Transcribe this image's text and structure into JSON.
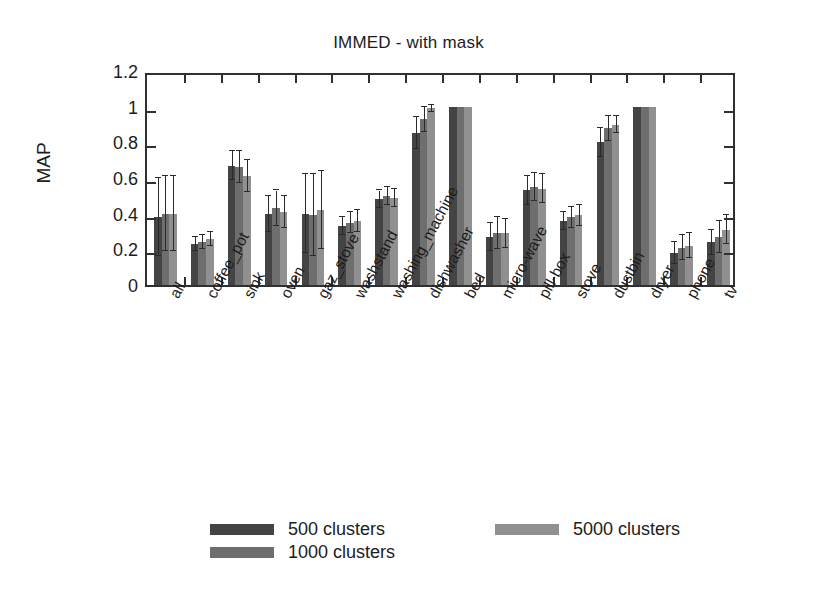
{
  "chart_data": {
    "type": "bar",
    "title": "IMMED - with mask",
    "xlabel": "",
    "ylabel": "MAP",
    "ylim": [
      0,
      1.2
    ],
    "yticks": [
      "0",
      "0.2",
      "0.4",
      "0.6",
      "0.8",
      "1",
      "1.2"
    ],
    "ytick_values": [
      0,
      0.2,
      0.4,
      0.6,
      0.8,
      1.0,
      1.2
    ],
    "grid": false,
    "legend_position": "below-plot",
    "error_bars": "yes",
    "categories": [
      "all",
      "coffee_pot",
      "sink",
      "oven",
      "gaz_stove",
      "washstand",
      "washing_machine",
      "dishwasher",
      "bed",
      "micro-wave",
      "pill-box",
      "stove",
      "dustbin",
      "dryer",
      "phone",
      "tv"
    ],
    "series": [
      {
        "name": "500 clusters",
        "color": "#444444",
        "values": [
          0.38,
          0.23,
          0.67,
          0.4,
          0.4,
          0.33,
          0.48,
          0.85,
          1.0,
          0.27,
          0.53,
          0.36,
          0.8,
          1.0,
          0.18,
          0.24
        ],
        "err_upper": [
          0.22,
          0.04,
          0.08,
          0.1,
          0.22,
          0.05,
          0.05,
          0.09,
          0.0,
          0.08,
          0.08,
          0.05,
          0.08,
          0.0,
          0.06,
          0.07
        ],
        "err_lower": [
          0.22,
          0.04,
          0.08,
          0.1,
          0.22,
          0.05,
          0.05,
          0.09,
          0.0,
          0.08,
          0.08,
          0.05,
          0.08,
          0.0,
          0.06,
          0.07
        ]
      },
      {
        "name": "1000 clusters",
        "color": "#6e6e6e",
        "values": [
          0.4,
          0.24,
          0.66,
          0.43,
          0.39,
          0.35,
          0.5,
          0.93,
          1.0,
          0.29,
          0.55,
          0.38,
          0.88,
          1.0,
          0.21,
          0.27
        ],
        "err_upper": [
          0.21,
          0.04,
          0.09,
          0.1,
          0.23,
          0.06,
          0.05,
          0.07,
          0.0,
          0.09,
          0.08,
          0.06,
          0.07,
          0.0,
          0.07,
          0.09
        ],
        "err_lower": [
          0.21,
          0.04,
          0.09,
          0.1,
          0.23,
          0.06,
          0.05,
          0.07,
          0.0,
          0.09,
          0.08,
          0.06,
          0.07,
          0.0,
          0.07,
          0.09
        ]
      },
      {
        "name": "5000 clusters",
        "color": "#909090",
        "values": [
          0.4,
          0.26,
          0.61,
          0.41,
          0.42,
          0.36,
          0.49,
          0.99,
          1.0,
          0.29,
          0.54,
          0.39,
          0.9,
          1.0,
          0.22,
          0.31
        ],
        "err_upper": [
          0.21,
          0.04,
          0.09,
          0.09,
          0.22,
          0.06,
          0.05,
          0.02,
          0.0,
          0.08,
          0.08,
          0.06,
          0.05,
          0.0,
          0.07,
          0.08
        ],
        "err_lower": [
          0.21,
          0.04,
          0.09,
          0.09,
          0.22,
          0.06,
          0.05,
          0.02,
          0.0,
          0.08,
          0.08,
          0.06,
          0.05,
          0.0,
          0.07,
          0.08
        ]
      }
    ]
  },
  "legend": {
    "items": [
      {
        "label": "500 clusters",
        "series": 0
      },
      {
        "label": "1000 clusters",
        "series": 1
      },
      {
        "label": "5000 clusters",
        "series": 2
      }
    ]
  },
  "colors": {
    "series_500": "#444444",
    "series_1000": "#6e6e6e",
    "series_5000": "#909090",
    "axis": "#303030",
    "background": "#ffffff",
    "text": "#1c1c1c"
  }
}
